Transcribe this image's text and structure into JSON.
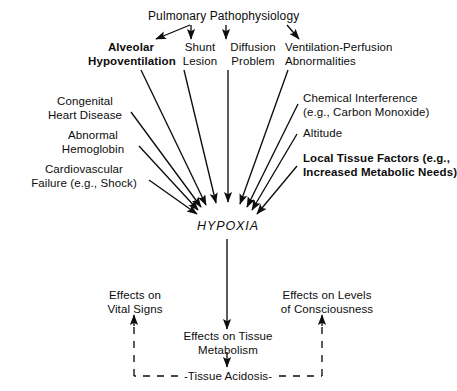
{
  "diagram": {
    "title": "Pulmonary Pathophysiology",
    "central_node": "HYPOXIA",
    "pulmonary_causes": [
      {
        "id": "alveolar",
        "label": "Alveolar\nHypoventilation",
        "bold": true
      },
      {
        "id": "shunt",
        "label": "Shunt\nLesion",
        "bold": false
      },
      {
        "id": "diffusion",
        "label": "Diffusion\nProblem",
        "bold": false
      },
      {
        "id": "ventilation",
        "label": "Ventilation-Perfusion\nAbnormalities",
        "bold": false
      }
    ],
    "left_causes": [
      {
        "id": "congenital",
        "label": "Congenital\nHeart Disease",
        "bold": false
      },
      {
        "id": "abnormal",
        "label": "Abnormal\nHemoglobin",
        "bold": false
      },
      {
        "id": "cardio",
        "label": "Cardiovascular\nFailure (e.g., Shock)",
        "bold": false
      }
    ],
    "right_causes": [
      {
        "id": "chemical",
        "label": "Chemical Interference\n(e.g., Carbon Monoxide)",
        "bold": false
      },
      {
        "id": "altitude",
        "label": "Altitude",
        "bold": false
      },
      {
        "id": "localtissue",
        "label": "Local Tissue Factors (e.g.,\nIncreased Metabolic Needs)",
        "bold": true
      }
    ],
    "effects": [
      {
        "id": "vitalsigns",
        "label": "Effects on\nVital Signs"
      },
      {
        "id": "tissuemet",
        "label": "Effects on Tissue\nMetabolism"
      },
      {
        "id": "conscious",
        "label": "Effects on Levels\nof Consciousness"
      }
    ],
    "feedback_node": "-Tissue Acidosis-",
    "ink_color": "#0d0d0d",
    "background_color": "#ffffff"
  }
}
